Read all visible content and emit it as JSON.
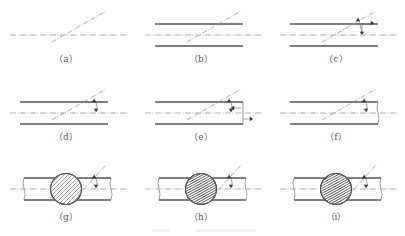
{
  "figure": {
    "panels": [
      {
        "id": "a",
        "label": "（a）",
        "walls": false,
        "centerline": true,
        "shaft": false,
        "angle_mark": false,
        "force_arrows": false,
        "wire_cut": "none"
      },
      {
        "id": "b",
        "label": "（b）",
        "walls": true,
        "centerline": true,
        "shaft": false,
        "angle_mark": false,
        "force_arrows": false,
        "wire_cut": "none"
      },
      {
        "id": "c",
        "label": "（c）",
        "walls": true,
        "centerline": true,
        "shaft": false,
        "angle_mark": false,
        "force_arrows": true,
        "wire_cut": "none"
      },
      {
        "id": "d",
        "label": "（d）",
        "walls": true,
        "centerline": true,
        "shaft": false,
        "angle_mark": true,
        "force_arrows": false,
        "wire_cut": "none"
      },
      {
        "id": "e",
        "label": "（e）",
        "walls": true,
        "centerline": true,
        "shaft": false,
        "angle_mark": true,
        "force_arrows": true,
        "wire_cut": "none"
      },
      {
        "id": "f",
        "label": "（f）",
        "walls": true,
        "centerline": true,
        "shaft": false,
        "angle_mark": true,
        "force_arrows": false,
        "wire_cut": "break-right"
      },
      {
        "id": "g",
        "label": "（g）",
        "walls": true,
        "centerline": true,
        "shaft": true,
        "angle_mark": true,
        "force_arrows": false,
        "wire_cut": "break-both",
        "section": "uniform-hatch"
      },
      {
        "id": "h",
        "label": "（h）",
        "walls": true,
        "centerline": true,
        "shaft": true,
        "angle_mark": true,
        "force_arrows": false,
        "wire_cut": "break-both",
        "section": "twisted-hatch"
      },
      {
        "id": "i",
        "label": "（i）",
        "walls": true,
        "centerline": true,
        "shaft": true,
        "angle_mark": true,
        "force_arrows": false,
        "wire_cut": "break-both",
        "section": "twisted-hatch"
      }
    ],
    "caption_visible_but_illegible": true
  }
}
